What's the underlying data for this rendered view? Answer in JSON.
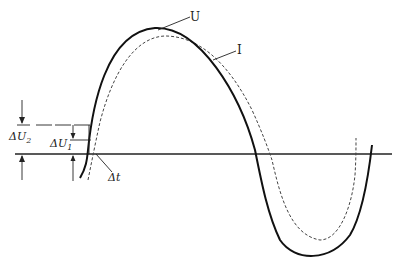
{
  "diagram": {
    "type": "waveform",
    "labels": {
      "voltage": "U",
      "current": "I",
      "delta_u2_main": "ΔU",
      "delta_u2_sub": "2",
      "delta_u1_main": "ΔU",
      "delta_u1_sub": "1",
      "delta_t": "Δt"
    },
    "series": [
      {
        "name": "U",
        "style": "solid",
        "color": "#111111"
      },
      {
        "name": "I",
        "style": "dashed",
        "color": "#444444"
      }
    ]
  }
}
